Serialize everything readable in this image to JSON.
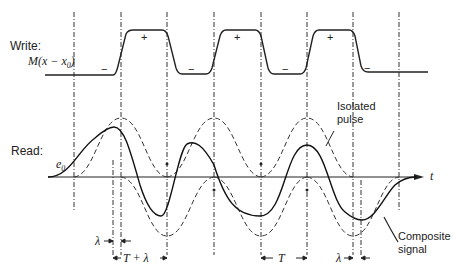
{
  "labels": {
    "write": "Write:",
    "write_fn": "M(x − x",
    "write_fn_sub": "0",
    "write_fn_close": ")",
    "read": "Read:",
    "e0": "e",
    "e0_sub": "0",
    "t_axis": "t",
    "isolated_1": "Isolated",
    "isolated_2": "pulse",
    "composite_1": "Composite",
    "composite_2": "signal",
    "lambda": "λ",
    "t_plus_lambda": "T + λ",
    "T": "T",
    "plus": "+",
    "minus": "−"
  },
  "write_signs": [
    "−",
    "+",
    "−",
    "+",
    "−",
    "+",
    "−"
  ],
  "colors": {
    "ink": "#222222",
    "background": "#ffffff"
  }
}
